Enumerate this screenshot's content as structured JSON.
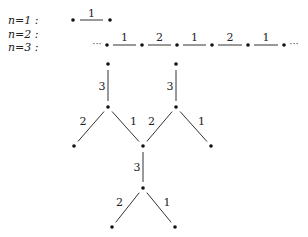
{
  "rows": [
    {
      "label": "n=1 :",
      "y": 20
    },
    {
      "label": "n=2 :",
      "y": 34
    },
    {
      "label": "n=3 :",
      "y": 47
    }
  ],
  "n1": {
    "nodes": [
      [
        73,
        20
      ],
      [
        110,
        20
      ]
    ],
    "edges": [
      {
        "from": 0,
        "to": 1,
        "label": "1"
      }
    ]
  },
  "n2": {
    "leading_ellipsis": "···",
    "trailing_ellipsis": "···",
    "y": 45,
    "nodes_x": [
      107,
      142,
      177,
      212,
      248,
      284
    ],
    "edge_labels": [
      "1",
      "2",
      "1",
      "2",
      "1"
    ]
  },
  "n3": {
    "nodes": [
      [
        108,
        64
      ],
      [
        108,
        107
      ],
      [
        74,
        146
      ],
      [
        143,
        146
      ],
      [
        176,
        64
      ],
      [
        176,
        107
      ],
      [
        211,
        146
      ],
      [
        143,
        188
      ],
      [
        112,
        227
      ],
      [
        175,
        227
      ]
    ],
    "edges": [
      {
        "from": 0,
        "to": 1,
        "label": "3"
      },
      {
        "from": 1,
        "to": 2,
        "label": "2"
      },
      {
        "from": 1,
        "to": 3,
        "label": "1"
      },
      {
        "from": 4,
        "to": 5,
        "label": "3"
      },
      {
        "from": 5,
        "to": 3,
        "label": "2"
      },
      {
        "from": 5,
        "to": 6,
        "label": "1"
      },
      {
        "from": 3,
        "to": 7,
        "label": "3"
      },
      {
        "from": 7,
        "to": 8,
        "label": "2"
      },
      {
        "from": 7,
        "to": 9,
        "label": "1"
      }
    ]
  }
}
